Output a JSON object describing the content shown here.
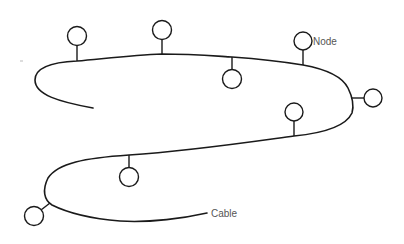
{
  "diagram": {
    "type": "bus-network",
    "labels": {
      "node": "Node",
      "cable": "Cable"
    },
    "colors": {
      "line": "#1a1a1a",
      "label": "#555555",
      "background": "#ffffff"
    },
    "node_count": 8
  }
}
